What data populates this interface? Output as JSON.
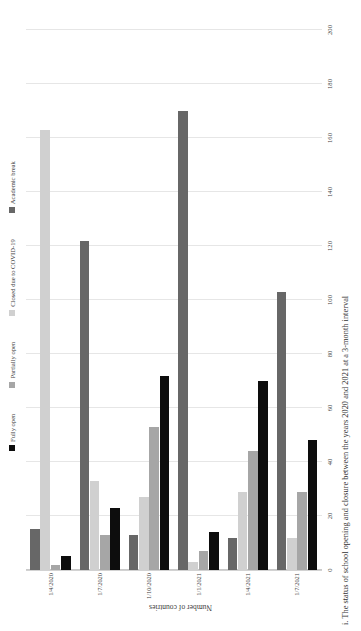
{
  "figure": {
    "caption": "i. The status of school opening and closure between the years 2020 and 2021 at a 3-month interval"
  },
  "legend": {
    "position": "top",
    "items": [
      {
        "label": "Fully open",
        "color": "#0d0d0d",
        "swatch_name": "legend-swatch-fully-open"
      },
      {
        "label": "Partially open",
        "color": "#a6a6a6",
        "swatch_name": "legend-swatch-partially-open"
      },
      {
        "label": "Closed due to COVID-19",
        "color": "#d0d0d0",
        "swatch_name": "legend-swatch-closed-covid"
      },
      {
        "label": "Academic break",
        "color": "#676767",
        "swatch_name": "legend-swatch-academic-break"
      }
    ]
  },
  "chart_data": {
    "type": "bar",
    "orientation": "horizontal",
    "title": "",
    "subtitle": "",
    "xlabel": "",
    "ylabel": "Number of countries",
    "ylim": [
      0,
      200
    ],
    "ytick_step": 20,
    "yticks": [
      "0",
      "20",
      "40",
      "60",
      "80",
      "100",
      "120",
      "140",
      "160",
      "180",
      "200"
    ],
    "grid": true,
    "legend_position": "top",
    "categories": [
      "1/4/2020",
      "1/7/2020",
      "1/10/2020",
      "1/1/2021",
      "1/4/2021",
      "1/7/2021"
    ],
    "series": [
      {
        "name": "Fully open",
        "color": "#0d0d0d",
        "values": [
          5,
          23,
          72,
          14,
          70,
          48
        ]
      },
      {
        "name": "Partially open",
        "color": "#a6a6a6",
        "values": [
          2,
          13,
          53,
          7,
          44,
          29
        ]
      },
      {
        "name": "Closed due to COVID-19",
        "color": "#d0d0d0",
        "values": [
          163,
          33,
          27,
          3,
          29,
          12
        ]
      },
      {
        "name": "Academic break",
        "color": "#676767",
        "values": [
          15,
          122,
          13,
          170,
          12,
          103
        ]
      }
    ]
  }
}
